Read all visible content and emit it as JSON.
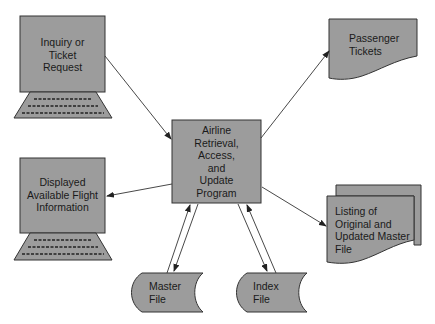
{
  "diagram": {
    "type": "system flowchart",
    "fill_color": "#9c9c9c",
    "stroke_color": "#333333",
    "nodes": {
      "inquiry": {
        "shape": "terminal",
        "label": "Inquiry or Ticket Request",
        "lines": [
          "Inquiry or",
          "Ticket",
          "Request"
        ]
      },
      "display": {
        "shape": "terminal",
        "label": "Displayed Available Flight Information",
        "lines": [
          "Displayed",
          "Available Flight",
          "Information"
        ]
      },
      "program": {
        "shape": "process",
        "label": "Airline Retrieval, Access, and Update Program",
        "lines": [
          "Airline",
          "Retrieval,",
          "Access,",
          "and",
          "Update",
          "Program"
        ]
      },
      "tickets": {
        "shape": "document",
        "label": "Passenger Tickets",
        "lines": [
          "Passenger",
          "Tickets"
        ]
      },
      "listing": {
        "shape": "multi-document",
        "label": "Listing of Original and Updated Master File",
        "lines": [
          "Listing of",
          "Original and",
          "Updated Master",
          "File"
        ]
      },
      "master": {
        "shape": "stored-data",
        "label": "Master File",
        "lines": [
          "Master",
          "File"
        ]
      },
      "index": {
        "shape": "stored-data",
        "label": "Index File",
        "lines": [
          "Index",
          "File"
        ]
      }
    },
    "edges": [
      {
        "from": "inquiry",
        "to": "program"
      },
      {
        "from": "program",
        "to": "display"
      },
      {
        "from": "program",
        "to": "tickets"
      },
      {
        "from": "program",
        "to": "listing"
      },
      {
        "from": "master",
        "to": "program"
      },
      {
        "from": "program",
        "to": "master"
      },
      {
        "from": "program",
        "to": "index"
      },
      {
        "from": "index",
        "to": "program"
      }
    ]
  }
}
